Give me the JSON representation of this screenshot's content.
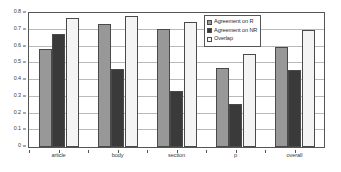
{
  "chart_data": {
    "type": "bar",
    "title": "",
    "subtitle": "",
    "xlabel": "",
    "ylabel": "",
    "categories": [
      "article",
      "body",
      "section",
      "p",
      "overall"
    ],
    "series": [
      {
        "name": "Agreement on R",
        "color": "#989898",
        "values": [
          0.585,
          0.735,
          0.705,
          0.473,
          0.595
        ]
      },
      {
        "name": "Agreement on NR",
        "color": "#3a3a3a",
        "values": [
          0.675,
          0.465,
          0.335,
          0.255,
          0.458
        ]
      },
      {
        "name": "Overlap",
        "color": "#f4f4f4",
        "values": [
          0.77,
          0.78,
          0.745,
          0.553,
          0.698
        ]
      }
    ],
    "ylim": [
      0,
      0.8
    ],
    "ytick_labels": [
      "0",
      "0.1",
      "0.2",
      "0.3",
      "0.4",
      "0.5",
      "0.6",
      "0.7",
      "0.8"
    ],
    "ytick_values": [
      0,
      0.1,
      0.2,
      0.3,
      0.4,
      0.5,
      0.6,
      0.7,
      0.8
    ],
    "grid": true,
    "legend_position": "top-right"
  }
}
